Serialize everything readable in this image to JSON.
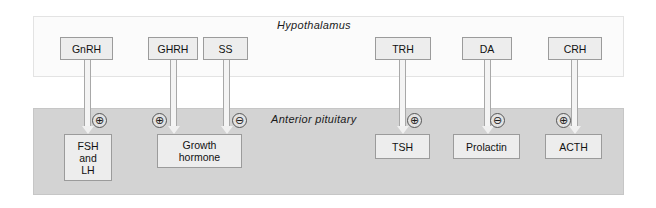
{
  "figure": {
    "background_color": "#ffffff"
  },
  "panels": [
    {
      "id": "hypothalamus",
      "label": "Hypothalamus",
      "fill_color": "#fbfbfb",
      "border_color": "#e3e3e3"
    },
    {
      "id": "anterior-pituitary",
      "label": "Anterior  pituitary",
      "fill_color": "#d3d3d3",
      "border_color": "#c6c6c6"
    }
  ],
  "hypothalamic_hormones": [
    {
      "id": "gnrh",
      "label": "GnRH"
    },
    {
      "id": "ghrh",
      "label": "GHRH"
    },
    {
      "id": "ss",
      "label": "SS"
    },
    {
      "id": "trh",
      "label": "TRH"
    },
    {
      "id": "da",
      "label": "DA"
    },
    {
      "id": "crh",
      "label": "CRH"
    }
  ],
  "pituitary_hormones": [
    {
      "id": "fsh-lh",
      "line1": "FSH",
      "line2": "and",
      "line3": "LH"
    },
    {
      "id": "growth-hormone",
      "line1": "Growth",
      "line2": "hormone"
    },
    {
      "id": "tsh",
      "label": "TSH"
    },
    {
      "id": "prolactin",
      "label": "Prolactin"
    },
    {
      "id": "acth",
      "label": "ACTH"
    }
  ],
  "signs": [
    {
      "id": "gnrh-fsh-lh",
      "symbol": "⊕",
      "meaning": "stimulatory",
      "from": "GnRH",
      "to": "FSH and LH"
    },
    {
      "id": "ghrh-gh",
      "symbol": "⊕",
      "meaning": "stimulatory",
      "from": "GHRH",
      "to": "Growth hormone"
    },
    {
      "id": "ss-gh",
      "symbol": "⊖",
      "meaning": "inhibitory",
      "from": "SS",
      "to": "Growth hormone"
    },
    {
      "id": "trh-tsh",
      "symbol": "⊕",
      "meaning": "stimulatory",
      "from": "TRH",
      "to": "TSH"
    },
    {
      "id": "da-prolactin",
      "symbol": "⊖",
      "meaning": "inhibitory",
      "from": "DA",
      "to": "Prolactin"
    },
    {
      "id": "crh-acth",
      "symbol": "⊕",
      "meaning": "stimulatory",
      "from": "CRH",
      "to": "ACTH"
    }
  ],
  "colors": {
    "node_fill": "#ededed",
    "node_border": "#9b9b9b",
    "arrow_fill": "#f4f4f4",
    "arrow_border": "#a8a8a8",
    "text": "#111111"
  }
}
